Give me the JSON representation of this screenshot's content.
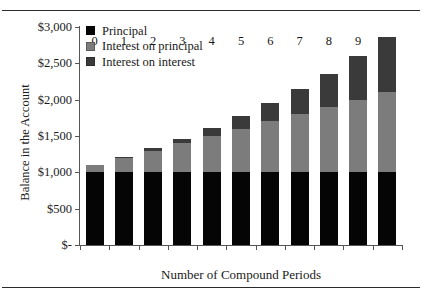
{
  "figure": {
    "top_rule": "horizontal-rule",
    "bottom_rule": "horizontal-rule"
  },
  "chart_data": {
    "type": "bar",
    "stacked": true,
    "title": "",
    "xlabel": "Number of Compound Periods",
    "ylabel": "Balance in the Account",
    "categories": [
      "0",
      "1",
      "2",
      "3",
      "4",
      "5",
      "6",
      "7",
      "8",
      "9",
      "10"
    ],
    "x": [
      0,
      1,
      2,
      3,
      4,
      5,
      6,
      7,
      8,
      9,
      10
    ],
    "ylim": [
      0,
      3000
    ],
    "yticks": [
      0,
      500,
      1000,
      1500,
      2000,
      2500,
      3000
    ],
    "ytick_labels": [
      "$-",
      "$500",
      "$1,000",
      "$1,500",
      "$2,000",
      "$2,500",
      "$3,000"
    ],
    "grid": false,
    "legend_position": "upper left",
    "series": [
      {
        "name": "Principal",
        "color": "#050505",
        "values": [
          1000,
          1000,
          1000,
          1000,
          1000,
          1000,
          1000,
          1000,
          1000,
          1000,
          1000
        ]
      },
      {
        "name": "Interest on principal",
        "color": "#7c7c7c",
        "values": [
          100,
          200,
          300,
          400,
          500,
          600,
          700,
          800,
          900,
          1000,
          1100
        ]
      },
      {
        "name": "Interest on interest",
        "color": "#3a3a3a",
        "values": [
          0,
          10,
          31,
          64,
          110,
          171,
          248,
          344,
          460,
          598,
          759
        ]
      }
    ],
    "totals": [
      1100,
      1210,
      1331,
      1464,
      1610,
      1771,
      1948,
      2144,
      2360,
      2598,
      2859
    ],
    "annotations": []
  },
  "legend": {
    "items": [
      {
        "label": "Principal",
        "color": "#050505",
        "swatch": "legend-swatch-principal"
      },
      {
        "label": "Interest on principal",
        "color": "#7c7c7c",
        "swatch": "legend-swatch-interest-on-principal"
      },
      {
        "label": "Interest on interest",
        "color": "#3a3a3a",
        "swatch": "legend-swatch-interest-on-interest"
      }
    ]
  }
}
